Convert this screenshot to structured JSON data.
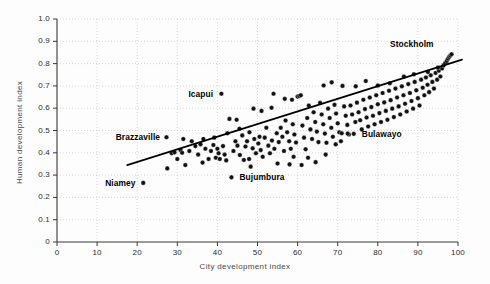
{
  "chart_data": {
    "type": "scatter",
    "title": "",
    "xlabel": "City development index",
    "ylabel": "Human development index",
    "xlim": [
      0,
      100
    ],
    "ylim": [
      0,
      1.0
    ],
    "xticks": [
      "0",
      "10",
      "20",
      "30",
      "40",
      "50",
      "60",
      "70",
      "80",
      "90",
      "100"
    ],
    "xtick_values": [
      0,
      10,
      20,
      30,
      40,
      50,
      60,
      70,
      80,
      90,
      100
    ],
    "yticks": [
      "0",
      "0.1",
      "0.2",
      "0.3",
      "0.4",
      "0.5",
      "0.6",
      "0.7",
      "0.8",
      "0.9",
      "1.0"
    ],
    "ytick_values": [
      0,
      0.1,
      0.2,
      0.3,
      0.4,
      0.5,
      0.6,
      0.7,
      0.8,
      0.9,
      1.0
    ],
    "grid": true,
    "legend": "none",
    "marker": {
      "shape": "circle",
      "color": "#111111",
      "size": 4.6
    },
    "trendline": {
      "type": "linear",
      "color": "#000000",
      "width": 1.7,
      "x": [
        17.5,
        101.0
      ],
      "y": [
        0.345,
        0.818
      ]
    },
    "annotations": [
      {
        "label": "Stockholm",
        "x": 96.5,
        "y": 0.836,
        "align": "right",
        "dx": -10,
        "dy": -12
      },
      {
        "label": "Icapui",
        "x": 41.0,
        "y": 0.665,
        "align": "right",
        "dx": -8,
        "dy": 0
      },
      {
        "label": "Brazzaville",
        "x": 27.6,
        "y": 0.47,
        "align": "right",
        "dx": -8,
        "dy": 0
      },
      {
        "label": "Bulawayo",
        "x": 74.0,
        "y": 0.485,
        "align": "left",
        "dx": 8,
        "dy": 0
      },
      {
        "label": "Bujumbura",
        "x": 43.5,
        "y": 0.29,
        "align": "left",
        "dx": 8,
        "dy": 0
      },
      {
        "label": "Niamey",
        "x": 21.5,
        "y": 0.265,
        "align": "right",
        "dx": -8,
        "dy": 0
      }
    ],
    "points": [
      [
        21.5,
        0.265
      ],
      [
        27.3,
        0.47
      ],
      [
        27.5,
        0.33
      ],
      [
        28.6,
        0.398
      ],
      [
        29.3,
        0.402
      ],
      [
        30.8,
        0.412
      ],
      [
        31.2,
        0.4
      ],
      [
        31.5,
        0.462
      ],
      [
        32.0,
        0.345
      ],
      [
        33.6,
        0.452
      ],
      [
        34.5,
        0.43
      ],
      [
        35.2,
        0.392
      ],
      [
        35.8,
        0.438
      ],
      [
        36.3,
        0.356
      ],
      [
        37.0,
        0.418
      ],
      [
        37.8,
        0.372
      ],
      [
        38.4,
        0.408
      ],
      [
        39.0,
        0.435
      ],
      [
        39.6,
        0.378
      ],
      [
        40.0,
        0.418
      ],
      [
        40.3,
        0.398
      ],
      [
        40.6,
        0.372
      ],
      [
        41.0,
        0.665
      ],
      [
        41.4,
        0.43
      ],
      [
        41.8,
        0.392
      ],
      [
        42.2,
        0.366
      ],
      [
        43.5,
        0.29
      ],
      [
        44.0,
        0.408
      ],
      [
        44.5,
        0.452
      ],
      [
        45.0,
        0.432
      ],
      [
        45.6,
        0.39
      ],
      [
        46.2,
        0.478
      ],
      [
        46.6,
        0.368
      ],
      [
        47.0,
        0.428
      ],
      [
        47.4,
        0.452
      ],
      [
        47.9,
        0.372
      ],
      [
        48.3,
        0.338
      ],
      [
        48.8,
        0.42
      ],
      [
        49.2,
        0.462
      ],
      [
        49.6,
        0.398
      ],
      [
        50.2,
        0.442
      ],
      [
        50.8,
        0.412
      ],
      [
        51.3,
        0.382
      ],
      [
        51.8,
        0.468
      ],
      [
        52.2,
        0.512
      ],
      [
        52.7,
        0.432
      ],
      [
        53.1,
        0.398
      ],
      [
        53.6,
        0.455
      ],
      [
        54.0,
        0.665
      ],
      [
        54.2,
        0.418
      ],
      [
        54.8,
        0.488
      ],
      [
        55.3,
        0.448
      ],
      [
        55.8,
        0.512
      ],
      [
        56.2,
        0.472
      ],
      [
        56.6,
        0.408
      ],
      [
        57.0,
        0.545
      ],
      [
        57.4,
        0.492
      ],
      [
        57.9,
        0.452
      ],
      [
        58.3,
        0.418
      ],
      [
        58.8,
        0.528
      ],
      [
        59.2,
        0.482
      ],
      [
        59.6,
        0.446
      ],
      [
        60.0,
        0.652
      ],
      [
        60.4,
        0.655
      ],
      [
        60.8,
        0.658
      ],
      [
        61.2,
        0.522
      ],
      [
        61.6,
        0.468
      ],
      [
        62.0,
        0.416
      ],
      [
        62.4,
        0.556
      ],
      [
        62.8,
        0.612
      ],
      [
        63.2,
        0.505
      ],
      [
        63.6,
        0.462
      ],
      [
        64.0,
        0.582
      ],
      [
        64.4,
        0.538
      ],
      [
        64.8,
        0.495
      ],
      [
        65.2,
        0.448
      ],
      [
        65.6,
        0.624
      ],
      [
        66.0,
        0.572
      ],
      [
        66.4,
        0.528
      ],
      [
        66.8,
        0.486
      ],
      [
        67.2,
        0.445
      ],
      [
        67.6,
        0.598
      ],
      [
        68.0,
        0.556
      ],
      [
        68.4,
        0.512
      ],
      [
        68.8,
        0.472
      ],
      [
        69.2,
        0.615
      ],
      [
        69.6,
        0.576
      ],
      [
        70.0,
        0.532
      ],
      [
        70.4,
        0.492
      ],
      [
        70.8,
        0.452
      ],
      [
        71.2,
        0.7
      ],
      [
        71.6,
        0.608
      ],
      [
        72.0,
        0.566
      ],
      [
        72.4,
        0.525
      ],
      [
        72.8,
        0.482
      ],
      [
        73.2,
        0.612
      ],
      [
        73.6,
        0.572
      ],
      [
        74.0,
        0.485
      ],
      [
        74.4,
        0.538
      ],
      [
        74.8,
        0.625
      ],
      [
        75.2,
        0.582
      ],
      [
        75.6,
        0.546
      ],
      [
        76.0,
        0.505
      ],
      [
        76.4,
        0.638
      ],
      [
        76.8,
        0.596
      ],
      [
        77.2,
        0.558
      ],
      [
        77.6,
        0.518
      ],
      [
        78.0,
        0.648
      ],
      [
        78.4,
        0.605
      ],
      [
        78.8,
        0.566
      ],
      [
        79.2,
        0.528
      ],
      [
        79.6,
        0.658
      ],
      [
        80.0,
        0.618
      ],
      [
        80.4,
        0.578
      ],
      [
        80.8,
        0.538
      ],
      [
        81.2,
        0.668
      ],
      [
        81.6,
        0.626
      ],
      [
        82.0,
        0.588
      ],
      [
        82.4,
        0.548
      ],
      [
        82.8,
        0.678
      ],
      [
        83.2,
        0.636
      ],
      [
        83.6,
        0.598
      ],
      [
        84.0,
        0.56
      ],
      [
        84.4,
        0.688
      ],
      [
        84.8,
        0.648
      ],
      [
        85.2,
        0.608
      ],
      [
        85.6,
        0.572
      ],
      [
        86.0,
        0.698
      ],
      [
        86.4,
        0.658
      ],
      [
        86.8,
        0.62
      ],
      [
        87.2,
        0.585
      ],
      [
        87.6,
        0.708
      ],
      [
        88.0,
        0.668
      ],
      [
        88.4,
        0.632
      ],
      [
        88.8,
        0.598
      ],
      [
        89.2,
        0.718
      ],
      [
        89.6,
        0.68
      ],
      [
        90.0,
        0.645
      ],
      [
        90.4,
        0.612
      ],
      [
        90.8,
        0.728
      ],
      [
        91.2,
        0.692
      ],
      [
        91.6,
        0.658
      ],
      [
        92.0,
        0.738
      ],
      [
        92.4,
        0.705
      ],
      [
        92.8,
        0.672
      ],
      [
        93.2,
        0.748
      ],
      [
        93.6,
        0.718
      ],
      [
        94.0,
        0.688
      ],
      [
        94.4,
        0.758
      ],
      [
        94.8,
        0.728
      ],
      [
        95.2,
        0.768
      ],
      [
        95.6,
        0.742
      ],
      [
        96.0,
        0.778
      ],
      [
        96.4,
        0.792
      ],
      [
        96.8,
        0.802
      ],
      [
        97.2,
        0.812
      ],
      [
        97.5,
        0.822
      ],
      [
        97.8,
        0.83
      ],
      [
        98.1,
        0.836
      ],
      [
        98.4,
        0.842
      ],
      [
        55.0,
        0.352
      ],
      [
        58.0,
        0.348
      ],
      [
        61.0,
        0.345
      ],
      [
        64.5,
        0.358
      ],
      [
        67.0,
        0.392
      ],
      [
        69.5,
        0.438
      ],
      [
        71.0,
        0.488
      ],
      [
        72.5,
        0.486
      ],
      [
        59.0,
        0.382
      ],
      [
        62.6,
        0.378
      ],
      [
        43.0,
        0.552
      ],
      [
        44.8,
        0.548
      ],
      [
        49.0,
        0.598
      ],
      [
        51.0,
        0.588
      ],
      [
        53.5,
        0.602
      ],
      [
        66.5,
        0.702
      ],
      [
        68.5,
        0.716
      ],
      [
        74.5,
        0.698
      ],
      [
        77.0,
        0.722
      ],
      [
        80.0,
        0.702
      ],
      [
        83.0,
        0.712
      ],
      [
        86.5,
        0.742
      ],
      [
        89.0,
        0.752
      ],
      [
        92.5,
        0.762
      ],
      [
        95.0,
        0.782
      ],
      [
        30.0,
        0.372
      ],
      [
        33.0,
        0.408
      ],
      [
        36.5,
        0.462
      ],
      [
        39.2,
        0.468
      ],
      [
        42.5,
        0.488
      ],
      [
        45.5,
        0.508
      ],
      [
        48.0,
        0.492
      ],
      [
        50.5,
        0.472
      ],
      [
        56.8,
        0.642
      ],
      [
        58.6,
        0.638
      ]
    ]
  }
}
